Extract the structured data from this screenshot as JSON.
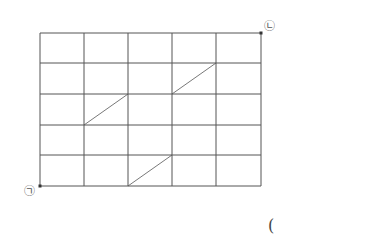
{
  "diagram": {
    "grid": {
      "columns": 5,
      "rows": 5,
      "x_lines": [
        40,
        84,
        128,
        172,
        216,
        261
      ],
      "y_lines": [
        33,
        63,
        94,
        125,
        155,
        186
      ],
      "line_color": "#555555"
    },
    "diagonals": [
      {
        "x1": 84,
        "y1": 125,
        "x2": 128,
        "y2": 94
      },
      {
        "x1": 172,
        "y1": 94,
        "x2": 216,
        "y2": 63
      },
      {
        "x1": 128,
        "y1": 186,
        "x2": 172,
        "y2": 155
      }
    ],
    "points": [
      {
        "label": "㉠",
        "x": 40,
        "y": 186
      },
      {
        "label": "㉡",
        "x": 261,
        "y": 33
      }
    ],
    "answer_paren": "("
  }
}
